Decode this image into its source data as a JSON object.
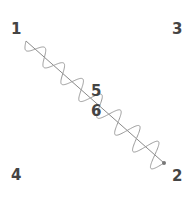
{
  "labels": {
    "one": "1",
    "two": "2",
    "three": "3",
    "four": "4",
    "five": "5",
    "six": "6"
  },
  "diagram": {
    "line_start": [
      26,
      41
    ],
    "line_end": [
      164,
      163
    ],
    "line_color": "#8a8a8a",
    "wave_color": "#9a9a9a",
    "endpoint_color": "#777777"
  }
}
